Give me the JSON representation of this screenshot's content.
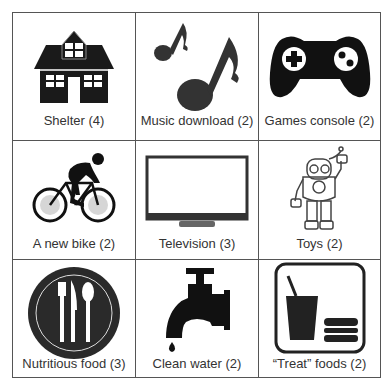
{
  "grid": {
    "border_color": "#555555",
    "items": [
      {
        "label": "Shelter (4)",
        "icon": "house-icon"
      },
      {
        "label": "Music download (2)",
        "icon": "music-notes-icon"
      },
      {
        "label": "Games console (2)",
        "icon": "gamepad-icon"
      },
      {
        "label": "A new bike (2)",
        "icon": "cyclist-icon"
      },
      {
        "label": "Television (3)",
        "icon": "television-icon"
      },
      {
        "label": "Toys (2)",
        "icon": "robot-toy-icon"
      },
      {
        "label": "Nutritious food (3)",
        "icon": "plate-cutlery-icon"
      },
      {
        "label": "Clean water (2)",
        "icon": "water-tap-icon"
      },
      {
        "label": "“Treat” foods (2)",
        "icon": "drink-burger-icon"
      }
    ]
  }
}
